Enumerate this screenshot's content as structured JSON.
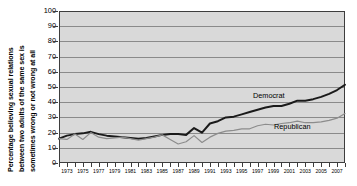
{
  "chart_data": {
    "type": "line",
    "title": "",
    "xlabel": "",
    "ylabel": "Percentage believing sexual relations between two adults of the same sex is sometimes wrong or not wrong at all",
    "ylabel_lines": [
      "Percentage believing sexual relations",
      "between two adults of the same sex is",
      "sometimes wrong or not wrong at all"
    ],
    "ylim": [
      0,
      100
    ],
    "ytick_step": 10,
    "yticks": [
      0,
      10,
      20,
      30,
      40,
      50,
      60,
      70,
      80,
      90,
      100
    ],
    "xlim": [
      1972,
      2008
    ],
    "xticks": [
      1973,
      1975,
      1977,
      1979,
      1981,
      1983,
      1985,
      1987,
      1989,
      1991,
      1993,
      1995,
      1997,
      1999,
      2001,
      2003,
      2005,
      2007
    ],
    "xticks_minor_step": 1,
    "grid": "horizontal",
    "legend_position": "inline-annotation",
    "plot_background": "#d9d9d9",
    "x": [
      1972,
      1973,
      1974,
      1975,
      1976,
      1977,
      1978,
      1979,
      1980,
      1981,
      1982,
      1983,
      1984,
      1985,
      1986,
      1987,
      1988,
      1989,
      1990,
      1991,
      1992,
      1993,
      1994,
      1995,
      1996,
      1997,
      1998,
      1999,
      2000,
      2001,
      2002,
      2003,
      2004,
      2005,
      2006,
      2007,
      2008
    ],
    "series": [
      {
        "name": "Democrat",
        "color": "#1a1a1a",
        "line_width": 2.0,
        "values": [
          16,
          18,
          19,
          19.5,
          20.5,
          19,
          18,
          17.5,
          17,
          16.5,
          16,
          16.5,
          17.5,
          18.5,
          19,
          19,
          18.5,
          23,
          20,
          26,
          27.5,
          30,
          30.5,
          32,
          33.5,
          35,
          36.5,
          37.5,
          37.5,
          39,
          41,
          41,
          42,
          43.5,
          45.5,
          48,
          51.5
        ]
      },
      {
        "name": "Republican",
        "color": "#8c8c8c",
        "line_width": 1.2,
        "values": [
          16,
          15.5,
          19,
          15.5,
          20,
          17,
          16,
          16.5,
          17,
          16,
          15,
          16,
          17,
          18.5,
          15.5,
          12.5,
          14,
          18,
          13.5,
          17,
          19.5,
          21,
          21.5,
          22.5,
          22.5,
          24.5,
          25.5,
          25,
          26,
          26.5,
          27.5,
          26.5,
          26.5,
          27,
          28,
          29.5,
          32.5
        ]
      }
    ],
    "annotations": [
      {
        "text": "Democrat",
        "series": "Democrat"
      },
      {
        "text": "Republican",
        "series": "Republican"
      }
    ]
  }
}
